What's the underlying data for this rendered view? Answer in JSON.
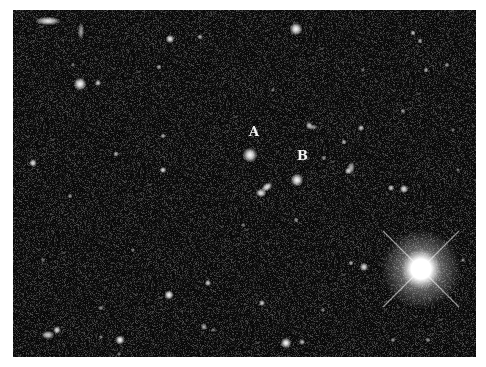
{
  "image": {
    "description": "Deep-sky astronomical field, greyscale, with two labeled objects",
    "background_color": "#0c0c0c",
    "star_color": "#ffffff"
  },
  "labels": [
    {
      "id": "A",
      "text": "A"
    },
    {
      "id": "B",
      "text": "B"
    }
  ]
}
